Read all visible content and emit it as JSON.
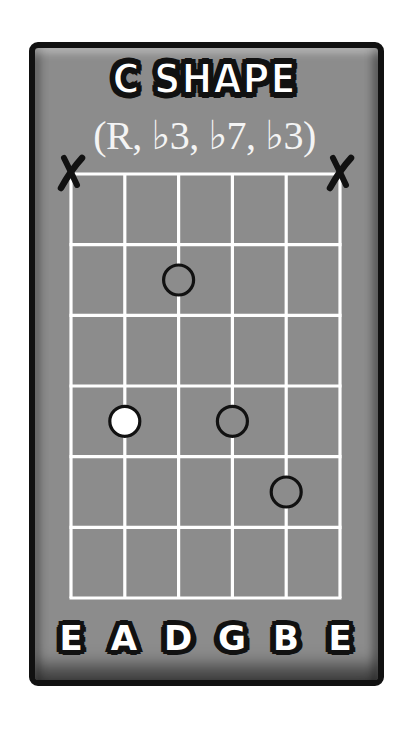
{
  "diagram": {
    "title": "C SHAPE",
    "subtitle": "(R, ♭3, ♭7, ♭3)",
    "strings": [
      "E",
      "A",
      "D",
      "G",
      "B",
      "E"
    ],
    "fret_rows": 6,
    "muted_strings": [
      1,
      6
    ],
    "dots": [
      {
        "string": 3,
        "fret": 2,
        "style": "open",
        "interval": "♭7"
      },
      {
        "string": 2,
        "fret": 4,
        "style": "filled",
        "interval": "R"
      },
      {
        "string": 4,
        "fret": 4,
        "style": "open",
        "interval": "♭3"
      },
      {
        "string": 5,
        "fret": 5,
        "style": "open",
        "interval": "♭3"
      }
    ],
    "colors": {
      "card_background": "#8c8c8c",
      "border": "#111111",
      "grid_lines": "#ffffff",
      "root_dot": "#ffffff",
      "dot_outline": "#111111"
    }
  }
}
